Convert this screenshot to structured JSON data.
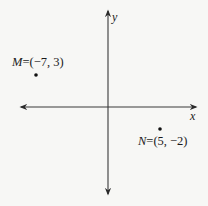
{
  "diagram": {
    "type": "coordinate-plane",
    "axes": {
      "x_label": "x",
      "y_label": "y"
    },
    "points": [
      {
        "name": "M",
        "x": -7,
        "y": 3,
        "label_name": "M",
        "label_coords": "=(−7, 3)"
      },
      {
        "name": "N",
        "x": 5,
        "y": -2,
        "label_name": "N",
        "label_coords": "=(5, −2)"
      }
    ],
    "colors": {
      "axis": "#3a3a3a",
      "point": "#111111",
      "background": "#f7f7f5"
    }
  }
}
